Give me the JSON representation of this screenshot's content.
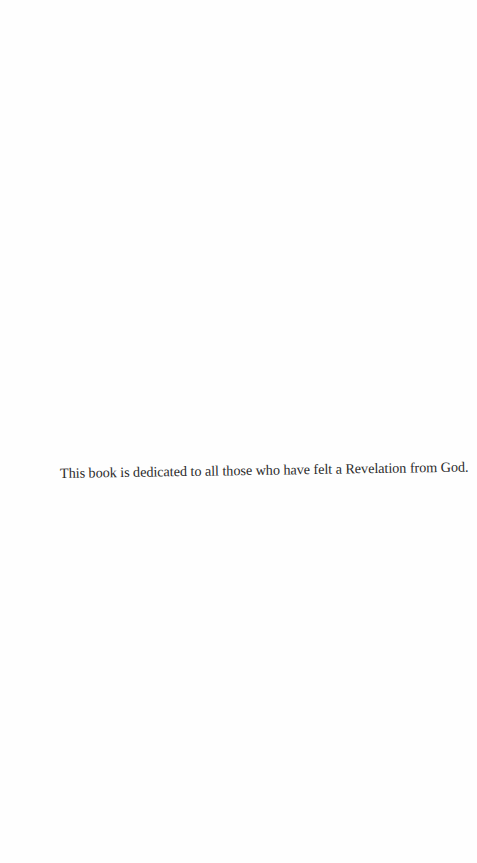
{
  "page": {
    "type": "dedication",
    "background_color": "#fefefe",
    "text_color": "#2a2a2a",
    "dedication_text": "This book is dedicated to all those who have felt a Revelation from God."
  }
}
